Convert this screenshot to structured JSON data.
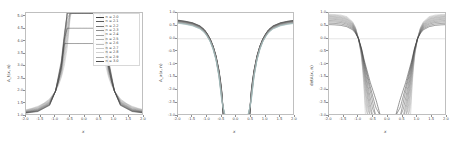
{
  "figure": {
    "background": "#ffffff",
    "frame_color": "#bfbfbf",
    "tick_color": "#4a4a4a",
    "zero_line_color": "#cccccc"
  },
  "legend": {
    "entries": [
      {
        "label": "n = 2.0",
        "color": "#3f3f3f"
      },
      {
        "label": "n = 2.1",
        "color": "#5a5a5a"
      },
      {
        "label": "n = 2.2",
        "color": "#767676"
      },
      {
        "label": "n = 2.3",
        "color": "#8d8d8d"
      },
      {
        "label": "n = 2.4",
        "color": "#a0a0a0"
      },
      {
        "label": "n = 2.5",
        "color": "#b0b0b0"
      },
      {
        "label": "n = 2.6",
        "color": "#bdbdbd"
      },
      {
        "label": "n = 2.7",
        "color": "#c8c8c8"
      },
      {
        "label": "n = 2.8",
        "color": "#d2d2d2"
      },
      {
        "label": "n = 2.9",
        "color": "#a8a8a8"
      },
      {
        "label": "n = 3.0",
        "color": "#4e4e4e"
      }
    ]
  },
  "chart_data": [
    {
      "type": "line",
      "panel": "left",
      "title": "",
      "xlabel": "x",
      "ylabel": "A_t(x, n)",
      "xlim": [
        -2.0,
        2.0
      ],
      "ylim": [
        1.0,
        5.15
      ],
      "xticks": [
        -2.0,
        -1.5,
        -1.0,
        -0.5,
        0.0,
        0.5,
        1.0,
        1.5,
        2.0
      ],
      "xticklabels": [
        "-2.0",
        "-1.5",
        "-1.0",
        "-0.5",
        "0.0",
        "0.5",
        "1.0",
        "1.5",
        "2.0"
      ],
      "yticks": [
        1.0,
        1.5,
        2.0,
        2.5,
        3.0,
        3.5,
        4.0,
        4.5,
        5.0
      ],
      "yticklabels": [
        "1.0",
        "1.5",
        "2.0",
        "2.5",
        "3.0",
        "3.5",
        "4.0",
        "4.5",
        "5.0"
      ],
      "grid": false,
      "legend_position": "upper right",
      "description": "Family of even, singular-at-origin curves A_t(x,n) = 1 + |x|^(-n) scaled; each curve diverges to +inf as x -> 0 and approaches 1 at |x| = 2.",
      "series": [
        {
          "name": "n = 2.0",
          "x": [
            -2.0,
            -1.8,
            -1.6,
            -1.4,
            -1.2,
            -1.0,
            -0.9,
            -0.8,
            -0.7,
            -0.6,
            -0.5,
            -0.45,
            -0.4,
            -0.35,
            -0.3,
            -0.25,
            -0.2,
            -0.15,
            -0.1,
            0.1,
            0.15,
            0.2,
            0.25,
            0.3,
            0.35,
            0.4,
            0.45,
            0.5,
            0.6,
            0.7,
            0.8,
            0.9,
            1.0,
            1.2,
            1.4,
            1.6,
            1.8,
            2.0
          ],
          "y": [
            1.25,
            1.31,
            1.39,
            1.51,
            1.69,
            2.0,
            2.23,
            2.56,
            3.04,
            3.78,
            5.0,
            5.15,
            5.15,
            5.15,
            5.15,
            5.15,
            5.15,
            5.15,
            5.15,
            5.15,
            5.15,
            5.15,
            5.15,
            5.15,
            5.15,
            5.15,
            5.15,
            5.0,
            3.78,
            3.04,
            2.56,
            2.23,
            2.0,
            1.69,
            1.51,
            1.39,
            1.31,
            1.25
          ]
        },
        {
          "name": "n = 2.2",
          "x": [
            -2.0,
            -1.6,
            -1.2,
            -1.0,
            -0.8,
            -0.6,
            -0.5,
            -0.4,
            -0.3,
            0.3,
            0.4,
            0.5,
            0.6,
            0.8,
            1.0,
            1.2,
            1.6,
            2.0
          ],
          "y": [
            1.22,
            1.34,
            1.63,
            2.0,
            2.7,
            4.2,
            5.15,
            5.15,
            5.15,
            5.15,
            5.15,
            5.15,
            4.2,
            2.7,
            2.0,
            1.63,
            1.34,
            1.22
          ]
        },
        {
          "name": "n = 2.4",
          "x": [
            -2.0,
            -1.6,
            -1.2,
            -1.0,
            -0.8,
            -0.6,
            -0.5,
            -0.4,
            0.4,
            0.5,
            0.6,
            0.8,
            1.0,
            1.2,
            1.6,
            2.0
          ],
          "y": [
            1.19,
            1.29,
            1.57,
            2.0,
            2.86,
            4.72,
            5.15,
            5.15,
            5.15,
            5.15,
            4.72,
            2.86,
            2.0,
            1.57,
            1.29,
            1.19
          ]
        },
        {
          "name": "n = 2.6",
          "x": [
            -2.0,
            -1.6,
            -1.2,
            -1.0,
            -0.8,
            -0.6,
            -0.5,
            0.5,
            0.6,
            0.8,
            1.0,
            1.2,
            1.6,
            2.0
          ],
          "y": [
            1.16,
            1.25,
            1.52,
            2.0,
            3.04,
            5.15,
            5.15,
            5.15,
            5.15,
            3.04,
            2.0,
            1.52,
            1.25,
            1.16
          ]
        },
        {
          "name": "n = 2.8",
          "x": [
            -2.0,
            -1.6,
            -1.2,
            -1.0,
            -0.8,
            -0.7,
            -0.6,
            0.6,
            0.7,
            0.8,
            1.0,
            1.2,
            1.6,
            2.0
          ],
          "y": [
            1.14,
            1.21,
            1.47,
            2.0,
            3.24,
            4.3,
            5.15,
            5.15,
            4.3,
            3.24,
            2.0,
            1.47,
            1.21,
            1.14
          ]
        },
        {
          "name": "n = 3.0",
          "x": [
            -2.0,
            -1.6,
            -1.2,
            -1.0,
            -0.9,
            -0.8,
            -0.7,
            0.7,
            0.8,
            0.9,
            1.0,
            1.2,
            1.6,
            2.0
          ],
          "y": [
            1.12,
            1.18,
            1.43,
            2.0,
            2.37,
            2.95,
            3.92,
            3.92,
            2.95,
            2.37,
            2.0,
            1.43,
            1.18,
            1.12
          ]
        }
      ]
    },
    {
      "type": "line",
      "panel": "middle",
      "title": "",
      "xlabel": "x",
      "ylabel": "A_x(x, n)",
      "xlim": [
        -2.0,
        2.0
      ],
      "ylim": [
        -3.0,
        1.0
      ],
      "xticks": [
        -2.0,
        -1.5,
        -1.0,
        -0.5,
        0.0,
        0.5,
        1.0,
        1.5,
        2.0
      ],
      "xticklabels": [
        "-2.0",
        "-1.5",
        "-1.0",
        "-0.5",
        "0.0",
        "0.5",
        "1.0",
        "1.5",
        "2.0"
      ],
      "yticks": [
        -3.0,
        -2.5,
        -2.0,
        -1.5,
        -1.0,
        -0.5,
        0.0,
        0.5,
        1.0
      ],
      "yticklabels": [
        "-3.0",
        "-2.5",
        "-2.0",
        "-1.5",
        "-1.0",
        "-0.5",
        "0.0",
        "0.5",
        "1.0"
      ],
      "grid": false,
      "legend_position": "none",
      "description": "Even family starting near y=0.6-0.75 at |x|=2, crossing zero near |x|=1.0, plunging to -3 near |x|=0.35-0.5. Thin dark band of 11 overlapping curves.",
      "zero_line": 0.0,
      "series": [
        {
          "name": "n = 2.0",
          "x": [
            -2.0,
            -1.75,
            -1.5,
            -1.25,
            -1.1,
            -1.0,
            -0.9,
            -0.8,
            -0.7,
            -0.6,
            -0.55,
            -0.5,
            -0.46,
            0.46,
            0.5,
            0.55,
            0.6,
            0.7,
            0.8,
            0.9,
            1.0,
            1.1,
            1.25,
            1.5,
            1.75,
            2.0
          ],
          "y": [
            0.72,
            0.68,
            0.62,
            0.5,
            0.36,
            0.2,
            0.0,
            -0.28,
            -0.66,
            -1.22,
            -1.6,
            -2.08,
            -3.0,
            -3.0,
            -2.08,
            -1.6,
            -1.22,
            -0.66,
            -0.28,
            0.0,
            0.2,
            0.36,
            0.5,
            0.62,
            0.68,
            0.72
          ]
        },
        {
          "name": "n = 2.5",
          "x": [
            -2.0,
            -1.75,
            -1.5,
            -1.25,
            -1.1,
            -1.0,
            -0.9,
            -0.8,
            -0.7,
            -0.6,
            -0.5,
            -0.42,
            0.42,
            0.5,
            0.6,
            0.7,
            0.8,
            0.9,
            1.0,
            1.1,
            1.25,
            1.5,
            1.75,
            2.0
          ],
          "y": [
            0.66,
            0.62,
            0.56,
            0.44,
            0.3,
            0.14,
            -0.06,
            -0.34,
            -0.74,
            -1.34,
            -2.22,
            -3.0,
            -3.0,
            -2.22,
            -1.34,
            -0.74,
            -0.34,
            -0.06,
            0.14,
            0.3,
            0.44,
            0.56,
            0.62,
            0.66
          ]
        },
        {
          "name": "n = 3.0",
          "x": [
            -2.0,
            -1.75,
            -1.5,
            -1.25,
            -1.1,
            -1.0,
            -0.9,
            -0.8,
            -0.7,
            -0.6,
            -0.5,
            -0.38,
            0.38,
            0.5,
            0.6,
            0.7,
            0.8,
            0.9,
            1.0,
            1.1,
            1.25,
            1.5,
            1.75,
            2.0
          ],
          "y": [
            0.6,
            0.56,
            0.5,
            0.38,
            0.24,
            0.08,
            -0.12,
            -0.42,
            -0.84,
            -1.48,
            -2.46,
            -3.0,
            -3.0,
            -2.46,
            -1.48,
            -0.84,
            -0.42,
            -0.12,
            0.08,
            0.24,
            0.38,
            0.5,
            0.56,
            0.6
          ]
        }
      ]
    },
    {
      "type": "line",
      "panel": "right",
      "title": "",
      "xlabel": "x",
      "ylabel": "detA(x, n)",
      "xlim": [
        -2.0,
        2.0
      ],
      "ylim": [
        -3.0,
        1.0
      ],
      "xticks": [
        -2.0,
        -1.5,
        -1.0,
        -0.5,
        0.0,
        0.5,
        1.0,
        1.5,
        2.0
      ],
      "xticklabels": [
        "-2.0",
        "-1.5",
        "-1.0",
        "-0.5",
        "0.0",
        "0.5",
        "1.0",
        "1.5",
        "2.0"
      ],
      "yticks": [
        -3.0,
        -2.5,
        -2.0,
        -1.5,
        -1.0,
        -0.5,
        0.0,
        0.5,
        1.0
      ],
      "yticklabels": [
        "-3.0",
        "-2.5",
        "-2.0",
        "-1.5",
        "-1.0",
        "-0.5",
        "0.0",
        "0.5",
        "1.0"
      ],
      "grid": false,
      "legend_position": "none",
      "description": "Even family fanning between y=0.55 and y=0.95 at |x|=2, all crossing zero at |x|=1.0, diverging downward to -3 between |x|=0.25 and |x|=0.7.",
      "zero_line": 0.0,
      "series": [
        {
          "name": "n = 2.0",
          "x": [
            -2.0,
            -1.8,
            -1.6,
            -1.4,
            -1.2,
            -1.1,
            -1.0,
            -0.95,
            -0.9,
            -0.85,
            -0.8,
            -0.78,
            -0.76,
            0.76,
            0.78,
            0.8,
            0.85,
            0.9,
            0.95,
            1.0,
            1.1,
            1.2,
            1.4,
            1.6,
            1.8,
            2.0
          ],
          "y": [
            0.95,
            0.94,
            0.92,
            0.86,
            0.66,
            0.44,
            0.0,
            -0.32,
            -0.72,
            -1.3,
            -2.2,
            -2.66,
            -3.0,
            -3.0,
            -2.66,
            -2.2,
            -1.3,
            -0.72,
            -0.32,
            0.0,
            0.44,
            0.66,
            0.86,
            0.92,
            0.94,
            0.95
          ]
        },
        {
          "name": "n = 2.2",
          "x": [
            -2.0,
            -1.8,
            -1.6,
            -1.4,
            -1.2,
            -1.1,
            -1.0,
            -0.9,
            -0.8,
            -0.72,
            -0.68,
            0.68,
            0.72,
            0.8,
            0.9,
            1.0,
            1.1,
            1.2,
            1.4,
            1.6,
            1.8,
            2.0
          ],
          "y": [
            0.9,
            0.89,
            0.86,
            0.8,
            0.61,
            0.4,
            0.0,
            -0.62,
            -1.7,
            -2.7,
            -3.0,
            -3.0,
            -2.7,
            -1.7,
            -0.62,
            0.0,
            0.4,
            0.61,
            0.8,
            0.86,
            0.89,
            0.9
          ]
        },
        {
          "name": "n = 2.4",
          "x": [
            -2.0,
            -1.8,
            -1.6,
            -1.4,
            -1.2,
            -1.1,
            -1.0,
            -0.9,
            -0.8,
            -0.65,
            -0.6,
            0.6,
            0.65,
            0.8,
            0.9,
            1.0,
            1.1,
            1.2,
            1.4,
            1.6,
            1.8,
            2.0
          ],
          "y": [
            0.84,
            0.83,
            0.8,
            0.74,
            0.56,
            0.36,
            0.0,
            -0.54,
            -1.4,
            -2.72,
            -3.0,
            -3.0,
            -2.72,
            -1.4,
            -0.54,
            0.0,
            0.36,
            0.56,
            0.74,
            0.8,
            0.83,
            0.84
          ]
        },
        {
          "name": "n = 2.6",
          "x": [
            -2.0,
            -1.8,
            -1.6,
            -1.4,
            -1.2,
            -1.1,
            -1.0,
            -0.9,
            -0.8,
            -0.6,
            -0.52,
            0.52,
            0.6,
            0.8,
            0.9,
            1.0,
            1.1,
            1.2,
            1.4,
            1.6,
            1.8,
            2.0
          ],
          "y": [
            0.76,
            0.75,
            0.72,
            0.66,
            0.5,
            0.31,
            0.0,
            -0.48,
            -1.18,
            -2.56,
            -3.0,
            -3.0,
            -2.56,
            -1.18,
            -0.48,
            0.0,
            0.31,
            0.5,
            0.66,
            0.72,
            0.75,
            0.76
          ]
        },
        {
          "name": "n = 2.8",
          "x": [
            -2.0,
            -1.8,
            -1.6,
            -1.4,
            -1.2,
            -1.1,
            -1.0,
            -0.9,
            -0.8,
            -0.6,
            -0.44,
            -0.4,
            0.4,
            0.44,
            0.6,
            0.8,
            0.9,
            1.0,
            1.1,
            1.2,
            1.4,
            1.6,
            1.8,
            2.0
          ],
          "y": [
            0.66,
            0.65,
            0.63,
            0.57,
            0.43,
            0.26,
            0.0,
            -0.42,
            -1.0,
            -2.04,
            -2.88,
            -3.0,
            -3.0,
            -2.88,
            -2.04,
            -1.0,
            -0.42,
            0.0,
            0.26,
            0.43,
            0.57,
            0.63,
            0.65,
            0.66
          ]
        },
        {
          "name": "n = 3.0",
          "x": [
            -2.0,
            -1.8,
            -1.6,
            -1.4,
            -1.2,
            -1.1,
            -1.0,
            -0.9,
            -0.8,
            -0.6,
            -0.4,
            -0.28,
            -0.25,
            0.25,
            0.28,
            0.4,
            0.6,
            0.8,
            0.9,
            1.0,
            1.1,
            1.2,
            1.4,
            1.6,
            1.8,
            2.0
          ],
          "y": [
            0.55,
            0.54,
            0.52,
            0.47,
            0.35,
            0.21,
            0.0,
            -0.36,
            -0.86,
            -1.7,
            -2.4,
            -2.9,
            -3.0,
            -3.0,
            -2.9,
            -2.4,
            -1.7,
            -0.86,
            -0.36,
            0.0,
            0.21,
            0.35,
            0.47,
            0.52,
            0.54,
            0.55
          ]
        }
      ]
    }
  ]
}
